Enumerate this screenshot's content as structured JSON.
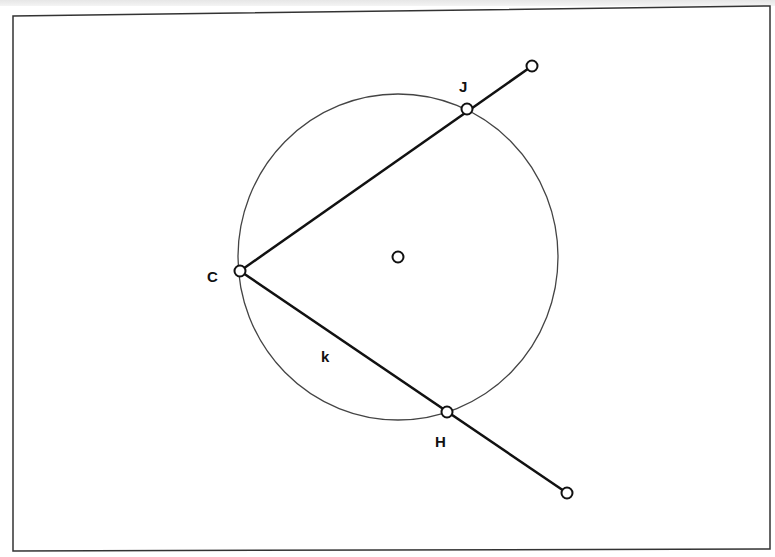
{
  "diagram": {
    "frame": {
      "x1": 13,
      "y1": 16,
      "x2": 770,
      "y2": 549,
      "stroke": "#333333"
    },
    "circle": {
      "cx": 398,
      "cy": 257,
      "rx": 160,
      "ry": 163,
      "stroke": "#444444"
    },
    "center_point": {
      "x": 398,
      "y": 257
    },
    "points": [
      {
        "id": "C",
        "x": 240,
        "y": 271,
        "label": "C",
        "label_x": 207,
        "label_y": 282
      },
      {
        "id": "J",
        "x": 467,
        "y": 109,
        "label": "J",
        "label_x": 459,
        "label_y": 92
      },
      {
        "id": "H",
        "x": 447,
        "y": 412,
        "label": "H",
        "label_x": 435,
        "label_y": 447
      },
      {
        "id": "ray1_end",
        "x": 532,
        "y": 66
      },
      {
        "id": "ray2_end",
        "x": 567,
        "y": 493
      }
    ],
    "segment_label": {
      "text": "k",
      "x": 321,
      "y": 362
    },
    "labels": {
      "C": "C",
      "J": "J",
      "H": "H",
      "k": "k"
    }
  }
}
